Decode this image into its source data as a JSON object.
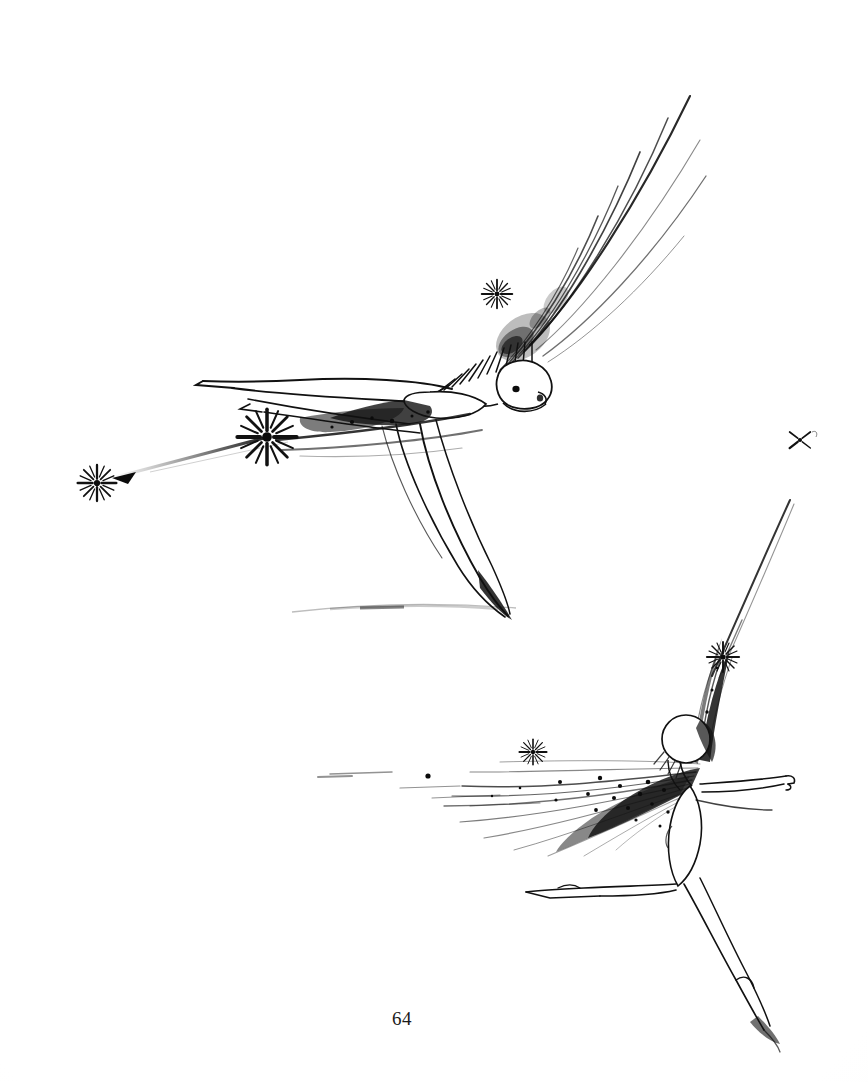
{
  "page": {
    "kind": "illustration-plate",
    "medium": "pen-and-ink drawing",
    "folio": "64",
    "background_color": "#fdfdfd",
    "ink_color": "#111111",
    "width": 868,
    "height": 1082
  },
  "caption": {
    "text": "",
    "present": false
  },
  "artwork": {
    "title": "",
    "description": "Two winged fairy figures rendered in black ink on white paper",
    "figures": [
      {
        "id": "upper-fairy",
        "name": "flying-fairy-upper",
        "pose": "flying horizontally, arms stretched forward to the left, legs trailing down-right",
        "facing": "left",
        "head_center": [
          525,
          385
        ],
        "wing_direction": "up-right",
        "wing_tip": [
          690,
          95
        ],
        "ground_line_y": 612,
        "sparkles": [
          {
            "name": "sparkle-head",
            "x": 497,
            "y": 294,
            "size": 34
          },
          {
            "name": "sparkle-hand-large",
            "x": 267,
            "y": 437,
            "size": 62
          },
          {
            "name": "sparkle-trail-left",
            "x": 97,
            "y": 483,
            "size": 40
          }
        ]
      },
      {
        "id": "lower-fairy",
        "name": "leaping-fairy-lower",
        "pose": "leaping / landing, right arm extended to the right, legs split in a lunge",
        "facing": "right",
        "head_center": [
          686,
          739
        ],
        "wing_direction": "sweeping left, long trailing plume",
        "wing_tip": [
          320,
          770
        ],
        "wand_tip": [
          790,
          500
        ],
        "sparkles": [
          {
            "name": "sparkle-wand",
            "x": 723,
            "y": 657,
            "size": 34
          },
          {
            "name": "sparkle-plume",
            "x": 533,
            "y": 752,
            "size": 30
          }
        ]
      }
    ],
    "marks": [
      {
        "id": "corner-sparkle",
        "name": "sparkle-right-margin",
        "x": 800,
        "y": 440,
        "size": 22,
        "note": "small four-pointed sparkle near right edge"
      }
    ]
  }
}
